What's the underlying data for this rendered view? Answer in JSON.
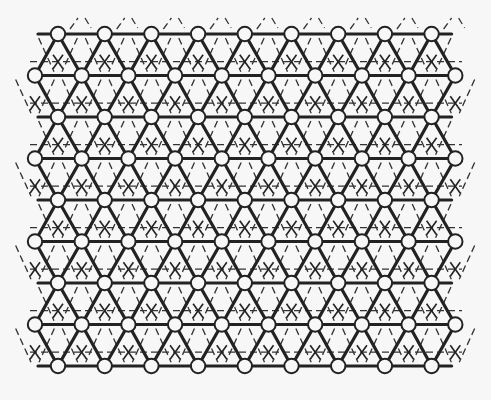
{
  "diagram": {
    "title": "",
    "type": "triangular lattice with overlaid dashed sublattice",
    "colors": {
      "background": "#f7f7f7",
      "line": "#222222",
      "node_fill": "#f7f7f7"
    },
    "lattice": {
      "rows": 9,
      "row_y0": 34,
      "row_spacing": 41.5,
      "col_spacing": 46.7,
      "even_row_x0": 58,
      "even_row_count": 9,
      "odd_row_x0": 35,
      "odd_row_count": 10,
      "node_radius": 7.2
    },
    "elements": {
      "nodes": "open circles at lattice sites",
      "solid_bonds": "thick horizontal and diagonal lines between neighbouring sites",
      "dashed_sublattice": "dashed horizontal and diagonal lines through triangle centroids",
      "x_marks": "X marks at centroids of upward triangles"
    }
  }
}
